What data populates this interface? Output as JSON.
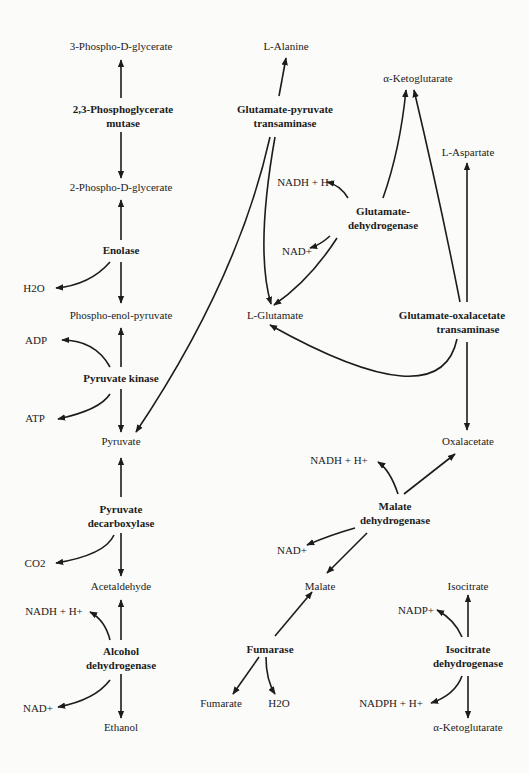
{
  "diagram": {
    "compounds": {
      "pg3": "3-Phospho-D-glycerate",
      "pg2": "2-Phospho-D-glycerate",
      "pep": "Phospho-enol-pyruvate",
      "pyruvate": "Pyruvate",
      "acetaldehyde": "Acetaldehyde",
      "ethanol": "Ethanol",
      "h2o_1": "H2O",
      "adp": "ADP",
      "atp": "ATP",
      "co2": "CO2",
      "nadh_1": "NADH + H+",
      "nad_1": "NAD+",
      "alanine": "L-Alanine",
      "glutamate": "L-Glutamate",
      "akg_top": "α-Ketoglutarate",
      "aspartate": "L-Aspartate",
      "nadh_2": "NADH + H+",
      "nad_2": "NAD+",
      "oxalacetate": "Oxalacetate",
      "nadh_3": "NADH + H+",
      "nad_3": "NAD+",
      "malate": "Malate",
      "fumarate": "Fumarate",
      "h2o_2": "H2O",
      "isocitrate": "Isocitrate",
      "nadp": "NADP+",
      "nadph": "NADPH + H+",
      "akg_bottom": "α-Ketoglutarate"
    },
    "enzymes": {
      "pgm_1": "2,3-Phosphoglycerate",
      "pgm_2": "mutase",
      "enolase": "Enolase",
      "pk": "Pyruvate kinase",
      "pdc_1": "Pyruvate",
      "pdc_2": "decarboxylase",
      "adh_1": "Alcohol",
      "adh_2": "dehydrogenase",
      "gpt_1": "Glutamate-pyruvate",
      "gpt_2": "transaminase",
      "gdh_1": "Glutamate-",
      "gdh_2": "dehydrogenase",
      "got_1": "Glutamate-oxalacetate",
      "got_2": "transaminase",
      "mdh_1": "Malate",
      "mdh_2": "dehydrogenase",
      "fumarase": "Fumarase",
      "idh_1": "Isocitrate",
      "idh_2": "dehydrogenase"
    },
    "colors": {
      "ink": "#1c1c1c",
      "background": "#fbfbf9"
    }
  }
}
